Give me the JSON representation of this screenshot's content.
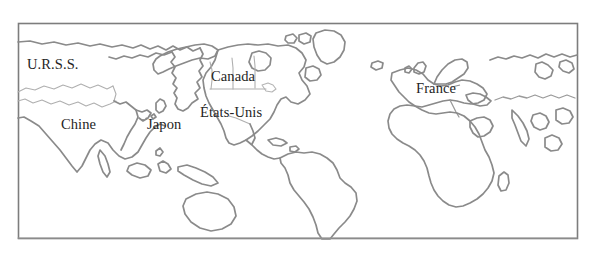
{
  "map": {
    "title": "Carte du monde",
    "projection": "world-outline",
    "frame": {
      "x": 18,
      "y": 23,
      "width": 560,
      "height": 216
    },
    "colors": {
      "background": "#ffffff",
      "coastline": "#8a8a8a",
      "border_line": "#9a9a9a",
      "frame": "#7d7d7d",
      "label_text": "#242424"
    },
    "labels": [
      {
        "id": "urss",
        "text": "U.R.S.S.",
        "x": 27,
        "y": 57
      },
      {
        "id": "chine",
        "text": "Chine",
        "x": 61,
        "y": 117
      },
      {
        "id": "japon",
        "text": "Japon",
        "x": 147,
        "y": 117
      },
      {
        "id": "canada",
        "text": "Canada",
        "x": 211,
        "y": 69
      },
      {
        "id": "etats",
        "text": "États-Unis",
        "x": 200,
        "y": 105
      },
      {
        "id": "france",
        "text": "France",
        "x": 416,
        "y": 81
      }
    ]
  }
}
